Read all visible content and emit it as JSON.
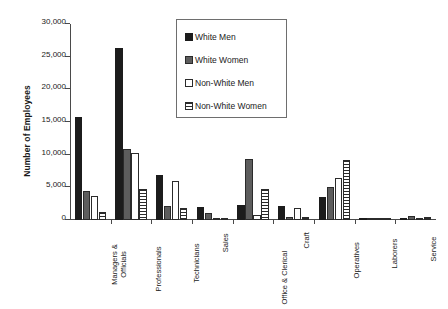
{
  "chart_data": {
    "type": "bar",
    "title": "",
    "xlabel": "",
    "ylabel": "Number of Employees",
    "ylim": [
      0,
      30000
    ],
    "ytick_labels": [
      "0",
      "5,000",
      "10,000",
      "15,000",
      "20,000",
      "25,000",
      "30,000"
    ],
    "ytick_values": [
      0,
      5000,
      10000,
      15000,
      20000,
      25000,
      30000
    ],
    "grid": false,
    "legend_position": "upper-center",
    "categories": [
      "Managers &\nOfficials",
      "Professionals",
      "Technicians",
      "Sales",
      "Office & Clerical",
      "Craft",
      "Operatives",
      "Laborers",
      "Service"
    ],
    "category_lines": [
      [
        "Managers &",
        "Officials"
      ],
      [
        "Professionals"
      ],
      [
        "Technicians"
      ],
      [
        "Sales"
      ],
      [
        "Office & Clerical"
      ],
      [
        "Craft"
      ],
      [
        "Operatives"
      ],
      [
        "Laborers"
      ],
      [
        "Service"
      ]
    ],
    "series": [
      {
        "name": "White Men",
        "fill": "solid-black",
        "color": "#1c1c1c",
        "values": [
          15800,
          26300,
          6900,
          2000,
          2300,
          2200,
          3500,
          300,
          300
        ]
      },
      {
        "name": "White Women",
        "fill": "solid-gray",
        "color": "#5d5d5d",
        "values": [
          4400,
          10800,
          2200,
          1000,
          9300,
          400,
          5100,
          150,
          600
        ]
      },
      {
        "name": "Non-White Men",
        "fill": "open-white",
        "color": "#ffffff",
        "values": [
          3700,
          10300,
          6000,
          300,
          700,
          1800,
          6500,
          250,
          250
        ]
      },
      {
        "name": "Non-White Women",
        "fill": "horizontal-hatch",
        "color": "#ffffff",
        "values": [
          1200,
          4700,
          1800,
          150,
          4800,
          400,
          9200,
          100,
          500
        ]
      }
    ]
  }
}
